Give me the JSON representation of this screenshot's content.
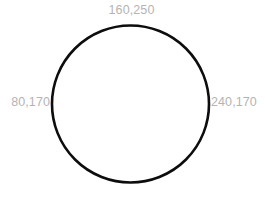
{
  "canvas": {
    "width": 265,
    "height": 197,
    "background_color": "#ffffff"
  },
  "shape": {
    "kind": "circle",
    "stroke_color": "#0d0d0d",
    "stroke_width": 2.6,
    "fill": "none",
    "center_x": 130.5,
    "center_y": 104,
    "radius": 78.5
  },
  "labels": {
    "top": "160,250",
    "left": "80,170",
    "right": "240,170",
    "text_color": "#b4b4b4",
    "font_size_px": 12.5
  },
  "chart_data": {
    "type": "scatter",
    "title": "",
    "xlabel": "",
    "ylabel": "",
    "grid": false,
    "legend": "none",
    "shape": "circle",
    "center": [
      160,
      170
    ],
    "radius": 80,
    "xlim": [
      80,
      240
    ],
    "ylim": [
      90,
      250
    ],
    "points": [
      {
        "label": "160,250",
        "x": 160,
        "y": 250,
        "position": "top"
      },
      {
        "label": "80,170",
        "x": 80,
        "y": 170,
        "position": "left"
      },
      {
        "label": "240,170",
        "x": 240,
        "y": 170,
        "position": "right"
      }
    ]
  }
}
